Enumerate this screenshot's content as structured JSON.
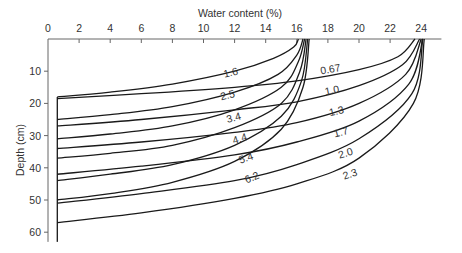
{
  "chart_data": {
    "type": "line",
    "title": "",
    "xlabel": "Water content (%)",
    "ylabel": "Depth (cm)",
    "x_ticks": [
      0,
      2,
      4,
      6,
      8,
      10,
      12,
      14,
      16,
      18,
      20,
      22,
      24
    ],
    "y_ticks": [
      10,
      20,
      30,
      40,
      50,
      60
    ],
    "xlim": [
      0,
      25
    ],
    "ylim": [
      0,
      63
    ],
    "x_axis_position": "top",
    "y_axis_inverted": true,
    "grid": false,
    "legend": "none (curves labelled inline)",
    "families": [
      {
        "name": "drying from 16.5% (left family)",
        "surface_water_content": 16.5,
        "curves": [
          {
            "label": "1.6",
            "front_depth_cm": 18,
            "points": [
              [
                0.6,
                18
              ],
              [
                4,
                16.5
              ],
              [
                8,
                14
              ],
              [
                12,
                10
              ],
              [
                14.5,
                6
              ],
              [
                15.8,
                2.5
              ],
              [
                16.1,
                0
              ]
            ]
          },
          {
            "label": "2.5",
            "front_depth_cm": 25,
            "points": [
              [
                0.6,
                25
              ],
              [
                4,
                23.5
              ],
              [
                8,
                21
              ],
              [
                12,
                16.5
              ],
              [
                14.8,
                11
              ],
              [
                16,
                5
              ],
              [
                16.4,
                0
              ]
            ]
          },
          {
            "label": "3.4",
            "front_depth_cm": 31,
            "points": [
              [
                0.6,
                31
              ],
              [
                4,
                29.5
              ],
              [
                8,
                27
              ],
              [
                12,
                22
              ],
              [
                15,
                15
              ],
              [
                16.1,
                7
              ],
              [
                16.5,
                0
              ]
            ]
          },
          {
            "label": "4.4",
            "front_depth_cm": 37,
            "points": [
              [
                0.6,
                37
              ],
              [
                4,
                35.5
              ],
              [
                8,
                33
              ],
              [
                12,
                27.5
              ],
              [
                15,
                20
              ],
              [
                16.2,
                10
              ],
              [
                16.6,
                0
              ]
            ]
          },
          {
            "label": "5.4",
            "front_depth_cm": 44,
            "points": [
              [
                0.6,
                44
              ],
              [
                4,
                42
              ],
              [
                8,
                39
              ],
              [
                12,
                33
              ],
              [
                15,
                24
              ],
              [
                16.3,
                13
              ],
              [
                16.7,
                0
              ]
            ]
          },
          {
            "label": "6.2",
            "front_depth_cm": 50,
            "points": [
              [
                0.6,
                50
              ],
              [
                4,
                48
              ],
              [
                8,
                44.5
              ],
              [
                12,
                38
              ],
              [
                15,
                28
              ],
              [
                16.4,
                15
              ],
              [
                16.8,
                0
              ]
            ]
          }
        ]
      },
      {
        "name": "drying from 24% (right family)",
        "surface_water_content": 24,
        "curves": [
          {
            "label": "0.67",
            "front_depth_cm": 18.5,
            "points": [
              [
                0.6,
                18.5
              ],
              [
                6,
                17
              ],
              [
                12,
                15
              ],
              [
                16,
                13
              ],
              [
                20,
                9.5
              ],
              [
                22.5,
                5.5
              ],
              [
                23.6,
                0
              ]
            ]
          },
          {
            "label": "1.0",
            "front_depth_cm": 27,
            "points": [
              [
                0.6,
                27
              ],
              [
                6,
                25
              ],
              [
                12,
                22
              ],
              [
                16,
                19.5
              ],
              [
                20,
                14.5
              ],
              [
                22.8,
                8
              ],
              [
                23.9,
                0
              ]
            ]
          },
          {
            "label": "1.3",
            "front_depth_cm": 34,
            "points": [
              [
                0.6,
                34
              ],
              [
                6,
                32
              ],
              [
                12,
                29
              ],
              [
                16,
                26
              ],
              [
                20,
                20
              ],
              [
                23,
                11
              ],
              [
                24,
                0
              ]
            ]
          },
          {
            "label": "1.7",
            "front_depth_cm": 42,
            "points": [
              [
                0.6,
                42
              ],
              [
                6,
                39.5
              ],
              [
                12,
                36
              ],
              [
                16,
                32
              ],
              [
                20,
                25.5
              ],
              [
                23.2,
                14
              ],
              [
                24.1,
                0
              ]
            ]
          },
          {
            "label": "2.0",
            "front_depth_cm": 51,
            "points": [
              [
                0.6,
                51
              ],
              [
                6,
                48
              ],
              [
                12,
                44
              ],
              [
                16,
                39
              ],
              [
                20,
                31
              ],
              [
                23.4,
                17
              ],
              [
                24.1,
                0
              ]
            ]
          },
          {
            "label": "2.3",
            "front_depth_cm": 57,
            "points": [
              [
                0.6,
                57
              ],
              [
                6,
                54
              ],
              [
                12,
                49.5
              ],
              [
                16,
                45
              ],
              [
                20,
                37
              ],
              [
                23.5,
                20
              ],
              [
                24.2,
                0
              ]
            ]
          }
        ]
      }
    ],
    "annotations": [
      "1.6",
      "2.5",
      "3.4",
      "4.4",
      "5.4",
      "6.2",
      "0.67",
      "1.0",
      "1.3",
      "1.7",
      "2.0",
      "2.3"
    ]
  },
  "labels": {
    "xlabel": "Water content (%)",
    "ylabel": "Depth (cm)",
    "x0": "0"
  }
}
